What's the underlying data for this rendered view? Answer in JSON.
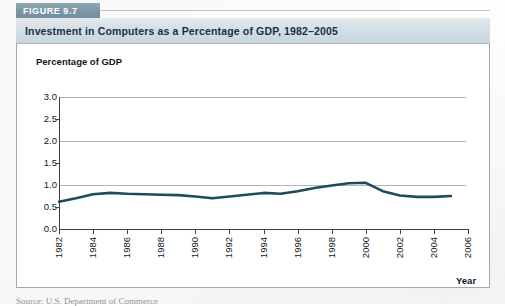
{
  "figure": {
    "label": "FIGURE 9.7",
    "title": "Investment in Computers as a Percentage of GDP, 1982–2005",
    "source_caption": "Source: U.S. Department of Commerce"
  },
  "colors": {
    "tab_background": "#7e98a7",
    "tab_text": "#ffffff",
    "title_band": "#d6e0e6",
    "title_text": "#1d2f47",
    "series_line": "#1f4c5b",
    "gridline": "#aeb4b8",
    "axis": "#3a4045",
    "frame_border": "#9fa9b0",
    "page_background": "#fbfbfa"
  },
  "chart_data": {
    "type": "line",
    "title": "Investment in Computers as a Percentage of GDP, 1982–2005",
    "xlabel": "Year",
    "ylabel": "Percentage of GDP",
    "ylim": [
      0.0,
      3.0
    ],
    "xlim": [
      1982,
      2006
    ],
    "grid": "horizontal-major",
    "gridline_values": [
      3.0,
      2.0,
      1.0
    ],
    "legend": "none",
    "ytick_labels": [
      "3.0",
      "2.5",
      "2.0",
      "1.5",
      "1.0",
      "0.5",
      "0.0"
    ],
    "ytick_values": [
      3.0,
      2.5,
      2.0,
      1.5,
      1.0,
      0.5,
      0.0
    ],
    "xtick_labels": [
      "1982",
      "1984",
      "1986",
      "1988",
      "1990",
      "1992",
      "1994",
      "1996",
      "1998",
      "2000",
      "2002",
      "2004",
      "2006"
    ],
    "xtick_values": [
      1982,
      1984,
      1986,
      1988,
      1990,
      1992,
      1994,
      1996,
      1998,
      2000,
      2002,
      2004,
      2006
    ],
    "x": [
      1982,
      1983,
      1984,
      1985,
      1986,
      1987,
      1988,
      1989,
      1990,
      1991,
      1992,
      1993,
      1994,
      1995,
      1996,
      1997,
      1998,
      1999,
      2000,
      2001,
      2002,
      2003,
      2004,
      2005
    ],
    "series": [
      {
        "name": "Investment in computers as a percentage of GDP",
        "values": [
          0.62,
          0.7,
          0.79,
          0.82,
          0.8,
          0.79,
          0.78,
          0.77,
          0.74,
          0.7,
          0.74,
          0.78,
          0.82,
          0.8,
          0.86,
          0.93,
          0.99,
          1.04,
          1.05,
          0.86,
          0.76,
          0.73,
          0.73,
          0.75
        ]
      }
    ]
  }
}
